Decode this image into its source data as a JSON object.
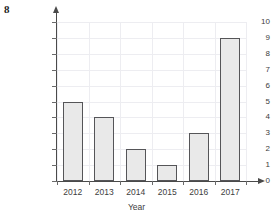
{
  "question_number": "8",
  "chart_data": {
    "type": "bar",
    "title": "",
    "categories": [
      "2012",
      "2013",
      "2014",
      "2015",
      "2016",
      "2017"
    ],
    "values": [
      5,
      4,
      2,
      1,
      3,
      9
    ],
    "xlabel": "Year",
    "ylabel": "Number of hurricanes",
    "ylim": [
      0,
      10
    ],
    "ytick_labels": [
      "0",
      "1",
      "2",
      "3",
      "4",
      "5",
      "6",
      "7",
      "8",
      "9",
      "10"
    ],
    "ytick_values": [
      0,
      1,
      2,
      3,
      4,
      5,
      6,
      7,
      8,
      9,
      10
    ],
    "grid": true,
    "legend": null,
    "bar_fill_color": "#e9e9e9",
    "bar_edge_color": "#555558",
    "grid_color": "#ededf1",
    "axis_color": "#4a4a4a"
  }
}
